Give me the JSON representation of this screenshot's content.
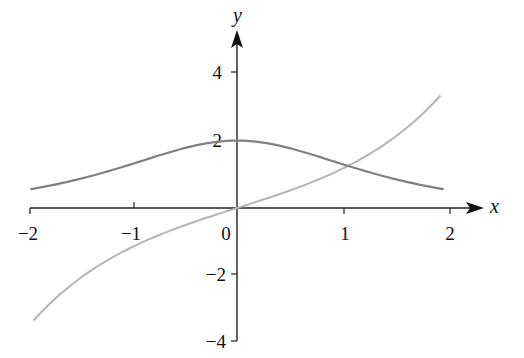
{
  "chart_data": {
    "type": "line",
    "title": "",
    "xlabel": "x",
    "ylabel": "y",
    "xlim": [
      -2,
      2
    ],
    "ylim": [
      -4,
      4
    ],
    "x_ticks": [
      "-2",
      "-1",
      "0",
      "1",
      "2"
    ],
    "y_ticks": [
      "4",
      "2",
      "-2",
      "-4"
    ],
    "grid": false,
    "legend": null,
    "series": [
      {
        "name": "dark curve (2 sech x)",
        "color": "#808080",
        "x": [
          -2,
          -1.5,
          -1,
          -0.5,
          0,
          0.5,
          1,
          1.5,
          2
        ],
        "values": [
          0.53,
          0.85,
          1.3,
          1.77,
          2.0,
          1.77,
          1.3,
          0.85,
          0.53
        ]
      },
      {
        "name": "light curve (sinh x)",
        "color": "#b5b5b5",
        "x": [
          -2,
          -1.5,
          -1,
          -0.5,
          0,
          0.5,
          1,
          1.5,
          2
        ],
        "values": [
          -3.63,
          -2.13,
          -1.18,
          -0.52,
          0.0,
          0.52,
          1.18,
          2.13,
          3.63
        ]
      }
    ]
  },
  "labels": {
    "x_axis": "x",
    "y_axis": "y",
    "xt": {
      "m2": "−2",
      "m1": "−1",
      "z": "0",
      "p1": "1",
      "p2": "2"
    },
    "yt": {
      "p4": "4",
      "p2": "2",
      "m2": "−2",
      "m4": "−4"
    }
  }
}
